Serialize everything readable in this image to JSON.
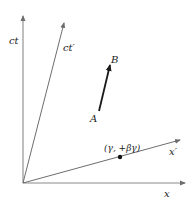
{
  "diagram": {
    "title": "",
    "axes": {
      "ct": {
        "label": "ct"
      },
      "ct_prime": {
        "label": "ct′"
      },
      "x": {
        "label": "x"
      },
      "x_prime": {
        "label": "x′"
      }
    },
    "vector": {
      "start_label": "A",
      "end_label": "B"
    },
    "point": {
      "label": "(γ, +βγ)"
    },
    "colors": {
      "axis": "#8a8a8a",
      "vector": "#1a1a1a",
      "text": "#222222",
      "background": "#ffffff"
    }
  }
}
